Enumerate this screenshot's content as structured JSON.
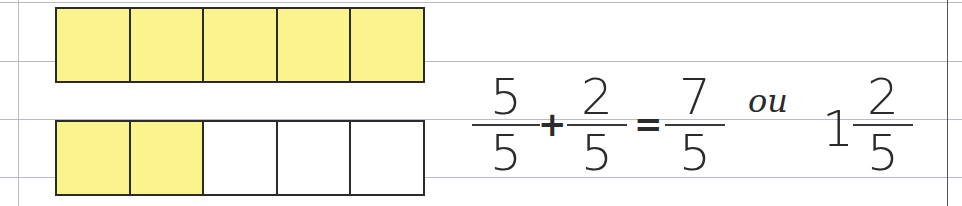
{
  "colors": {
    "filled": "#fbf48c",
    "empty": "#ffffff",
    "outline": "#2a2a2a",
    "ruled_line": "#b8bcc6",
    "margin_line": "#555555"
  },
  "bars": [
    {
      "name": "whole-unit",
      "cells": [
        true,
        true,
        true,
        true,
        true
      ]
    },
    {
      "name": "two-fifths",
      "cells": [
        true,
        true,
        false,
        false,
        false
      ]
    }
  ],
  "equation": {
    "term1": {
      "numerator": "5",
      "denominator": "5"
    },
    "plus": "+",
    "term2": {
      "numerator": "2",
      "denominator": "5"
    },
    "equals": "=",
    "result": {
      "numerator": "7",
      "denominator": "5"
    },
    "connector": "ou",
    "mixed": {
      "whole": "1",
      "numerator": "2",
      "denominator": "5"
    }
  }
}
